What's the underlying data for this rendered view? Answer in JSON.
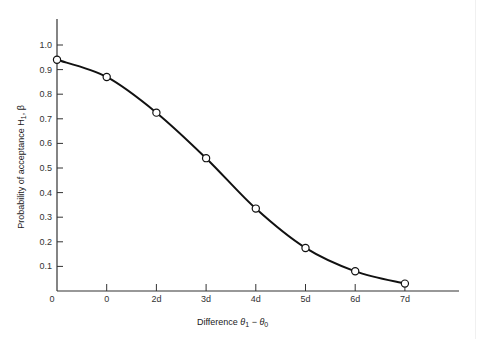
{
  "chart_data": {
    "type": "line",
    "title": "",
    "xlabel": "Difference θ₁ − θ₀",
    "ylabel": "Probability of acceptance H₁, β",
    "x_tick_labels": [
      "0",
      "0",
      "2d",
      "3d",
      "4d",
      "5d",
      "6d",
      "7d"
    ],
    "y_tick_labels": [
      "0.1",
      "0.2",
      "0.3",
      "0.4",
      "0.5",
      "0.6",
      "0.7",
      "0.8",
      "0.9",
      "1.0"
    ],
    "y_ticks": [
      0.1,
      0.2,
      0.3,
      0.4,
      0.5,
      0.6,
      0.7,
      0.8,
      0.9,
      1.0
    ],
    "ylim": [
      0,
      1.07
    ],
    "xlim": [
      0,
      8.05
    ],
    "grid": false,
    "legend": null,
    "series": [
      {
        "name": "OC curve",
        "marker": "open-circle",
        "x": [
          0,
          1,
          2,
          3,
          4,
          5,
          6,
          7
        ],
        "x_labels": [
          "0",
          "0",
          "2d",
          "3d",
          "4d",
          "5d",
          "6d",
          "7d"
        ],
        "values": [
          0.94,
          0.87,
          0.725,
          0.54,
          0.335,
          0.175,
          0.08,
          0.03
        ]
      }
    ]
  },
  "axes": {
    "origin_label": "0",
    "x_title_main": "Difference ",
    "x_title_theta1": "θ",
    "x_title_sub1": "1",
    "x_title_minus": " − ",
    "x_title_theta0": "θ",
    "x_title_sub0": "0",
    "y_title_main": "Probability of acceptance H",
    "y_title_sub": "1",
    "y_title_tail": ", β"
  },
  "colors": {
    "line": "#111111",
    "axis": "#333333",
    "marker_fill": "#ffffff"
  }
}
